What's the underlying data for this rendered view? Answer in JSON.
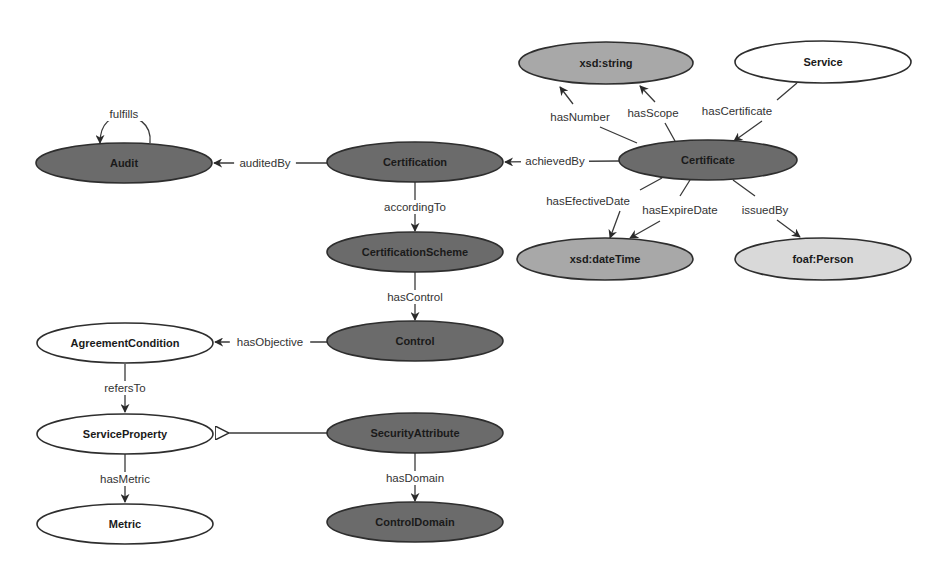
{
  "diagram": {
    "colors": {
      "class_dark": "#6b6b6b",
      "class_white": "#ffffff",
      "datatype_mid": "#a8a8a8",
      "external_light": "#d9d9d9",
      "stroke": "#2e2e2e"
    },
    "nodes": [
      {
        "id": "audit",
        "label": "Audit",
        "cx": 124,
        "cy": 163,
        "rx": 88,
        "ry": 20,
        "fill": "#6b6b6b"
      },
      {
        "id": "certification",
        "label": "Certification",
        "cx": 415,
        "cy": 162,
        "rx": 88,
        "ry": 20,
        "fill": "#6b6b6b"
      },
      {
        "id": "certification-scheme",
        "label": "CertificationScheme",
        "cx": 415,
        "cy": 252,
        "rx": 88,
        "ry": 20,
        "fill": "#6b6b6b"
      },
      {
        "id": "control",
        "label": "Control",
        "cx": 415,
        "cy": 341,
        "rx": 88,
        "ry": 20,
        "fill": "#6b6b6b"
      },
      {
        "id": "security-attribute",
        "label": "SecurityAttribute",
        "cx": 415,
        "cy": 433,
        "rx": 88,
        "ry": 20,
        "fill": "#6b6b6b"
      },
      {
        "id": "control-domain",
        "label": "ControlDomain",
        "cx": 415,
        "cy": 522,
        "rx": 88,
        "ry": 20,
        "fill": "#6b6b6b"
      },
      {
        "id": "agreement-condition",
        "label": "AgreementCondition",
        "cx": 125,
        "cy": 343,
        "rx": 88,
        "ry": 20,
        "fill": "#ffffff"
      },
      {
        "id": "service-property",
        "label": "ServiceProperty",
        "cx": 125,
        "cy": 434,
        "rx": 88,
        "ry": 20,
        "fill": "#ffffff"
      },
      {
        "id": "metric",
        "label": "Metric",
        "cx": 125,
        "cy": 524,
        "rx": 88,
        "ry": 20,
        "fill": "#ffffff"
      },
      {
        "id": "xsd-string",
        "label": "xsd:string",
        "cx": 606,
        "cy": 63,
        "rx": 87,
        "ry": 21,
        "fill": "#a8a8a8"
      },
      {
        "id": "service",
        "label": "Service",
        "cx": 823,
        "cy": 62,
        "rx": 88,
        "ry": 21,
        "fill": "#ffffff"
      },
      {
        "id": "certificate",
        "label": "Certificate",
        "cx": 708,
        "cy": 160,
        "rx": 89,
        "ry": 20,
        "fill": "#6b6b6b"
      },
      {
        "id": "xsd-datetime",
        "label": "xsd:dateTime",
        "cx": 605,
        "cy": 259,
        "rx": 88,
        "ry": 21,
        "fill": "#a8a8a8"
      },
      {
        "id": "foaf-person",
        "label": "foaf:Person",
        "cx": 823,
        "cy": 259,
        "rx": 88,
        "ry": 21,
        "fill": "#d9d9d9"
      }
    ],
    "edges": [
      {
        "id": "fulfills",
        "label": "fulfills",
        "from": "audit",
        "to": "audit",
        "path": "M150,143 C152,122 135,116 124,116 C112,116 100,122 100,143",
        "arrow": "filled",
        "lx": 124,
        "ly": 114
      },
      {
        "id": "auditedBy",
        "label": "auditedBy",
        "from": "certification",
        "to": "audit",
        "path": "M327,163 L214,163",
        "arrow": "filled",
        "lx": 265,
        "ly": 163
      },
      {
        "id": "accordingTo",
        "label": "accordingTo",
        "from": "certification",
        "to": "certification-scheme",
        "path": "M415,182 L415,231",
        "arrow": "filled",
        "lx": 415,
        "ly": 207
      },
      {
        "id": "hasControl",
        "label": "hasControl",
        "from": "certification-scheme",
        "to": "control",
        "path": "M415,272 L415,320",
        "arrow": "filled",
        "lx": 415,
        "ly": 297
      },
      {
        "id": "hasObjective",
        "label": "hasObjective",
        "from": "control",
        "to": "agreement-condition",
        "path": "M327,342 L215,342",
        "arrow": "filled",
        "lx": 270,
        "ly": 342
      },
      {
        "id": "refersTo",
        "label": "refersTo",
        "from": "agreement-condition",
        "to": "service-property",
        "path": "M125,364 L125,412",
        "arrow": "filled",
        "lx": 125,
        "ly": 388
      },
      {
        "id": "subclass",
        "label": "",
        "from": "security-attribute",
        "to": "service-property",
        "path": "M327,433 L228,433",
        "arrow": "hollow",
        "lx": 0,
        "ly": 0
      },
      {
        "id": "hasMetric",
        "label": "hasMetric",
        "from": "service-property",
        "to": "metric",
        "path": "M125,454 L125,502",
        "arrow": "filled",
        "lx": 125,
        "ly": 479
      },
      {
        "id": "hasDomain",
        "label": "hasDomain",
        "from": "security-attribute",
        "to": "control-domain",
        "path": "M415,453 L415,501",
        "arrow": "filled",
        "lx": 415,
        "ly": 478
      },
      {
        "id": "achievedBy",
        "label": "achievedBy",
        "from": "certificate",
        "to": "certification",
        "path": "M619,161 L505,162",
        "arrow": "filled",
        "lx": 555,
        "ly": 161
      },
      {
        "id": "hasNumber",
        "label": "hasNumber",
        "from": "certificate",
        "to": "xsd-string",
        "path": "M637,143 L600,127 M573,104 L560,87",
        "arrow": "filled",
        "lx": 580,
        "ly": 117
      },
      {
        "id": "hasScope",
        "label": "hasScope",
        "from": "certificate",
        "to": "xsd-string",
        "path": "M675,141 L665,123 M655,102 L640,86",
        "arrow": "filled",
        "lx": 653,
        "ly": 113
      },
      {
        "id": "hasCertificate",
        "label": "hasCertificate",
        "from": "service",
        "to": "certificate",
        "path": "M797,83 L777,100 M762,121 L734,141",
        "arrow": "filled",
        "lx": 737,
        "ly": 111
      },
      {
        "id": "hasEfectiveDate",
        "label": "hasEfectiveDate",
        "from": "certificate",
        "to": "xsd-datetime",
        "path": "M662,178 L640,190 M620,211 L610,238",
        "arrow": "filled",
        "lx": 588,
        "ly": 201
      },
      {
        "id": "hasExpireDate",
        "label": "hasExpireDate",
        "from": "certificate",
        "to": "xsd-datetime",
        "path": "M690,180 L680,196 M660,221 L630,238",
        "arrow": "filled",
        "lx": 680,
        "ly": 210
      },
      {
        "id": "issuedBy",
        "label": "issuedBy",
        "from": "certificate",
        "to": "foaf-person",
        "path": "M733,180 L755,196 M777,220 L800,237",
        "arrow": "filled",
        "lx": 765,
        "ly": 210
      }
    ]
  }
}
